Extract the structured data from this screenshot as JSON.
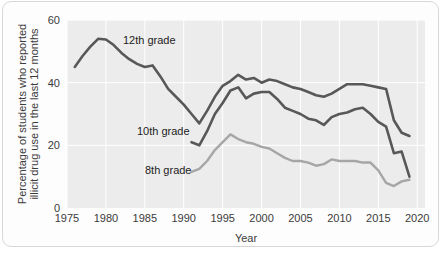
{
  "chart_data": {
    "type": "line",
    "title": "",
    "xlabel": "Year",
    "ylabel": "Percentage of students who reported illicit drug use in the last 12 months",
    "ylabel_line1": "Percentage of students who reported",
    "ylabel_line2": "illicit drug use in the last 12 months",
    "xlim": [
      1975,
      2021
    ],
    "ylim": [
      0,
      60
    ],
    "xticks": [
      1975,
      1980,
      1985,
      1990,
      1995,
      2000,
      2005,
      2010,
      2015,
      2020
    ],
    "yticks": [
      0,
      20,
      40,
      60
    ],
    "grid": true,
    "legend_position": "inline-annotations",
    "colors": {
      "grade12": "#58585a",
      "grade10": "#58585a",
      "grade8": "#a6a6a8",
      "plot_background": "#ececec",
      "gridline": "#ffffff",
      "card_background": "#fdfdfd",
      "card_border": "#d7d7d7",
      "text": "#3b3b3b"
    },
    "series": [
      {
        "name": "12th grade",
        "label": "12th grade",
        "color": "#58585a",
        "x": [
          1976,
          1977,
          1978,
          1979,
          1980,
          1981,
          1982,
          1983,
          1984,
          1985,
          1986,
          1987,
          1988,
          1989,
          1990,
          1991,
          1992,
          1993,
          1994,
          1995,
          1996,
          1997,
          1998,
          1999,
          2000,
          2001,
          2002,
          2003,
          2004,
          2005,
          2006,
          2007,
          2008,
          2009,
          2010,
          2011,
          2012,
          2013,
          2014,
          2015,
          2016,
          2017,
          2018,
          2019
        ],
        "values": [
          45.0,
          48.5,
          51.5,
          54.0,
          53.8,
          52.0,
          49.5,
          47.5,
          46.0,
          45.0,
          45.5,
          42.0,
          38.0,
          35.5,
          33.0,
          30.0,
          27.0,
          31.0,
          35.5,
          39.0,
          40.5,
          42.5,
          41.0,
          41.5,
          40.0,
          41.0,
          40.5,
          39.5,
          38.5,
          38.0,
          37.0,
          36.0,
          35.5,
          36.5,
          38.0,
          39.5,
          39.5,
          39.5,
          39.0,
          38.5,
          38.0,
          28.0,
          24.0,
          23.0
        ],
        "units": "percent"
      },
      {
        "name": "10th grade",
        "label": "10th grade",
        "color": "#58585a",
        "x": [
          1991,
          1992,
          1993,
          1994,
          1995,
          1996,
          1997,
          1998,
          1999,
          2000,
          2001,
          2002,
          2003,
          2004,
          2005,
          2006,
          2007,
          2008,
          2009,
          2010,
          2011,
          2012,
          2013,
          2014,
          2015,
          2016,
          2017,
          2018,
          2019
        ],
        "values": [
          21.0,
          20.0,
          24.5,
          30.0,
          33.5,
          37.5,
          38.5,
          35.0,
          36.5,
          37.0,
          37.0,
          34.8,
          32.0,
          31.0,
          30.0,
          28.5,
          28.0,
          26.5,
          29.0,
          30.0,
          30.5,
          31.5,
          32.0,
          30.0,
          27.5,
          26.0,
          17.5,
          18.0,
          10.0
        ],
        "units": "percent"
      },
      {
        "name": "8th grade",
        "label": "8th grade",
        "color": "#a6a6a8",
        "x": [
          1991,
          1992,
          1993,
          1994,
          1995,
          1996,
          1997,
          1998,
          1999,
          2000,
          2001,
          2002,
          2003,
          2004,
          2005,
          2006,
          2007,
          2008,
          2009,
          2010,
          2011,
          2012,
          2013,
          2014,
          2015,
          2016,
          2017,
          2018,
          2019
        ],
        "values": [
          11.5,
          12.5,
          15.0,
          18.5,
          21.0,
          23.5,
          22.0,
          21.0,
          20.5,
          19.5,
          19.0,
          17.5,
          16.0,
          15.0,
          15.0,
          14.5,
          13.5,
          14.0,
          15.5,
          15.0,
          15.0,
          15.0,
          14.5,
          14.5,
          12.0,
          8.0,
          7.0,
          8.5,
          9.0
        ],
        "units": "percent"
      }
    ],
    "annotations": [
      {
        "text": "12th grade",
        "x_px": 120,
        "y_px": 42,
        "series": "12th grade"
      },
      {
        "text": "10th grade",
        "x_px": 134,
        "y_px": 133,
        "series": "10th grade"
      },
      {
        "text": "8th grade",
        "x_px": 142,
        "y_px": 172,
        "series": "8th grade"
      }
    ]
  }
}
